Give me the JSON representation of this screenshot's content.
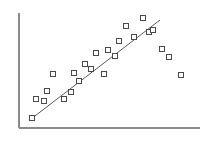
{
  "chart_data": {
    "type": "scatter",
    "title": "",
    "subtitle": "",
    "xlabel": "",
    "ylabel": "",
    "legend": [],
    "legend_position": "none",
    "grid": false,
    "axes": {
      "x_axis_visible": true,
      "y_axis_visible": true,
      "x_tick_labels": [],
      "y_tick_labels": [],
      "xlim": [
        0,
        100
      ],
      "ylim": [
        0,
        100
      ],
      "origin_px": {
        "x": 19,
        "y": 128
      },
      "x_axis_end_px": {
        "x": 200,
        "y": 128
      },
      "y_axis_top_px": {
        "x": 19,
        "y": 13
      }
    },
    "marker": {
      "shape": "open-square",
      "size_px": 5,
      "fill_color": "#ffffff",
      "edge_color": "#4a4a4a"
    },
    "points_px": [
      {
        "x": 32,
        "y": 118
      },
      {
        "x": 36,
        "y": 99
      },
      {
        "x": 44,
        "y": 101
      },
      {
        "x": 47,
        "y": 91
      },
      {
        "x": 53,
        "y": 74
      },
      {
        "x": 64,
        "y": 99
      },
      {
        "x": 71,
        "y": 92
      },
      {
        "x": 74,
        "y": 73
      },
      {
        "x": 79,
        "y": 81
      },
      {
        "x": 85,
        "y": 64
      },
      {
        "x": 91,
        "y": 69
      },
      {
        "x": 96,
        "y": 53
      },
      {
        "x": 104,
        "y": 74
      },
      {
        "x": 108,
        "y": 50
      },
      {
        "x": 115,
        "y": 56
      },
      {
        "x": 119,
        "y": 41
      },
      {
        "x": 126,
        "y": 26
      },
      {
        "x": 134,
        "y": 37
      },
      {
        "x": 143,
        "y": 18
      },
      {
        "x": 149,
        "y": 32
      },
      {
        "x": 153,
        "y": 30
      },
      {
        "x": 162,
        "y": 49
      },
      {
        "x": 169,
        "y": 57
      },
      {
        "x": 181,
        "y": 75
      }
    ],
    "x": [
      7.2,
      9.4,
      13.8,
      15.5,
      18.8,
      24.9,
      28.7,
      30.4,
      33.1,
      36.5,
      39.8,
      42.5,
      47.0,
      49.2,
      53.0,
      55.2,
      59.1,
      63.5,
      68.5,
      71.8,
      74.0,
      79.0,
      82.9,
      89.5
    ],
    "y": [
      8.7,
      25.2,
      23.5,
      32.2,
      47.0,
      25.2,
      31.3,
      47.8,
      40.9,
      55.7,
      51.3,
      65.2,
      47.0,
      67.8,
      62.6,
      75.7,
      88.7,
      79.1,
      95.7,
      83.5,
      85.2,
      68.7,
      61.7,
      46.1
    ]
  },
  "fit_line": {
    "type": "line",
    "name": "regression-line",
    "color": "#5a5a5a",
    "start_px": {
      "x": 31,
      "y": 119
    },
    "end_px": {
      "x": 160,
      "y": 20
    }
  }
}
